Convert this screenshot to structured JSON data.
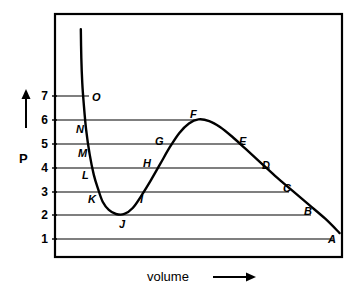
{
  "chart_data": {
    "type": "line",
    "title": "",
    "xlabel": "volume",
    "ylabel": "P",
    "grid": true,
    "legend": false,
    "ylim": [
      0,
      7.75
    ],
    "xlim": [
      0,
      12
    ],
    "y_ticks": [
      1,
      2,
      3,
      4,
      5,
      6,
      7
    ],
    "x_ticks": [],
    "series": [
      {
        "name": "isotherm",
        "x": [
          1.08,
          1.1,
          1.14,
          1.2,
          1.3,
          1.45,
          1.62,
          1.8,
          2.0,
          2.25,
          2.55,
          2.9,
          3.25,
          3.6,
          4.0,
          4.4,
          4.8,
          5.2,
          5.6,
          6.0,
          6.45,
          6.9,
          7.4,
          7.95,
          8.55,
          9.2,
          9.9,
          10.6,
          11.3,
          11.9
        ],
        "y": [
          9.8,
          8.6,
          7.55,
          6.7,
          5.6,
          4.55,
          3.7,
          3.1,
          2.55,
          2.22,
          2.05,
          2.05,
          2.3,
          2.8,
          3.45,
          4.15,
          4.85,
          5.45,
          5.85,
          6.02,
          5.95,
          5.7,
          5.3,
          4.8,
          4.25,
          3.65,
          3.05,
          2.45,
          1.85,
          1.25
        ]
      }
    ],
    "gridlines": [
      {
        "p": 7,
        "label": "7",
        "x_end": 2.02
      },
      {
        "p": 6,
        "label": "6",
        "x_end": 6.05
      },
      {
        "p": 5,
        "label": "5",
        "x_end": 8.05
      },
      {
        "p": 4,
        "label": "4",
        "x_end": 9.2
      },
      {
        "p": 3,
        "label": "3",
        "x_end": 10.0
      },
      {
        "p": 2,
        "label": "2",
        "x_end": 10.8
      },
      {
        "p": 1,
        "label": "1",
        "x_end": 11.6
      }
    ],
    "points": [
      {
        "label": "A",
        "p": 1.3,
        "x": 11.55,
        "lx": 328,
        "ly": 234
      },
      {
        "label": "B",
        "p": 2.0,
        "x": 10.8,
        "lx": 304,
        "ly": 206
      },
      {
        "label": "C",
        "p": 3.0,
        "x": 10.0,
        "lx": 283,
        "ly": 183
      },
      {
        "label": "D",
        "p": 4.0,
        "x": 9.2,
        "lx": 262,
        "ly": 160
      },
      {
        "label": "E",
        "p": 5.0,
        "x": 8.05,
        "lx": 239,
        "ly": 136
      },
      {
        "label": "F",
        "p": 6.05,
        "x": 6.05,
        "lx": 190,
        "ly": 109
      },
      {
        "label": "G",
        "p": 5.0,
        "x": 4.9,
        "lx": 155,
        "ly": 136
      },
      {
        "label": "H",
        "p": 4.0,
        "x": 4.35,
        "lx": 143,
        "ly": 158
      },
      {
        "label": "I",
        "p": 3.0,
        "x": 3.55,
        "lx": 140,
        "ly": 194
      },
      {
        "label": "J",
        "p": 2.0,
        "x": 2.72,
        "lx": 119,
        "ly": 219
      },
      {
        "label": "K",
        "p": 3.0,
        "x": 1.95,
        "lx": 88,
        "ly": 194
      },
      {
        "label": "L",
        "p": 4.0,
        "x": 1.68,
        "lx": 82,
        "ly": 170
      },
      {
        "label": "M",
        "p": 5.0,
        "x": 1.49,
        "lx": 78,
        "ly": 148
      },
      {
        "label": "N",
        "p": 6.0,
        "x": 1.33,
        "lx": 76,
        "ly": 124
      },
      {
        "label": "O",
        "p": 7.0,
        "x": 1.19,
        "lx": 92,
        "ly": 92
      }
    ]
  },
  "axes": {
    "y_axis_label": "P",
    "x_axis_label": "volume",
    "y_arrow": "up-arrow-icon",
    "x_arrow": "right-arrow-icon"
  }
}
